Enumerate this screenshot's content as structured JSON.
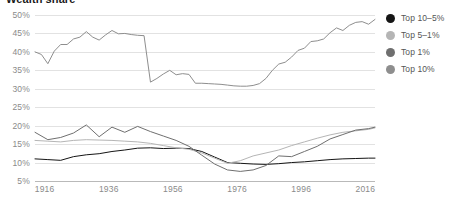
{
  "chart_data": {
    "type": "line",
    "title": "Wealth share",
    "xlabel": "",
    "ylabel": "",
    "xlim": [
      1913,
      2019
    ],
    "ylim": [
      5,
      50
    ],
    "grid": true,
    "y_tick_labels": [
      "50%",
      "45%",
      "40%",
      "35%",
      "30%",
      "25%",
      "20%",
      "15%",
      "10%",
      "5%"
    ],
    "y_tick_values": [
      50,
      45,
      40,
      35,
      30,
      25,
      20,
      15,
      10,
      5
    ],
    "x_tick_labels": [
      "1916",
      "1936",
      "1956",
      "1976",
      "1996",
      "2016"
    ],
    "x_tick_values": [
      1916,
      1936,
      1956,
      1976,
      1996,
      2016
    ],
    "legend_position": "right",
    "series": [
      {
        "name": "Top 10%",
        "color": "#8e8e8e",
        "x": [
          1913,
          1915,
          1917,
          1919,
          1921,
          1923,
          1925,
          1927,
          1929,
          1931,
          1933,
          1935,
          1937,
          1939,
          1941,
          1943,
          1945,
          1947,
          1949,
          1951,
          1953,
          1955,
          1957,
          1959,
          1961,
          1963,
          1965,
          1967,
          1969,
          1971,
          1973,
          1975,
          1977,
          1979,
          1981,
          1983,
          1985,
          1987,
          1989,
          1991,
          1993,
          1995,
          1997,
          1999,
          2001,
          2003,
          2005,
          2007,
          2009,
          2011,
          2013,
          2015,
          2017,
          2019
        ],
        "values": [
          40.0,
          39.3,
          36.8,
          40.2,
          42.0,
          42.0,
          43.5,
          44.0,
          45.5,
          44.0,
          43.2,
          44.6,
          45.8,
          44.9,
          45.0,
          44.7,
          44.5,
          44.4,
          31.8,
          32.8,
          34.0,
          35.0,
          33.8,
          34.1,
          33.9,
          31.5,
          31.5,
          31.4,
          31.3,
          31.2,
          31.0,
          30.8,
          30.7,
          30.7,
          30.9,
          31.4,
          32.8,
          35.0,
          36.7,
          37.2,
          38.6,
          40.4,
          41.0,
          42.8,
          43.0,
          43.5,
          45.2,
          46.5,
          45.8,
          47.2,
          48.0,
          48.2,
          47.5,
          48.8
        ]
      },
      {
        "name": "Top 10–5%",
        "color": "#151515",
        "x": [
          1913,
          1917,
          1921,
          1925,
          1929,
          1933,
          1937,
          1941,
          1945,
          1949,
          1953,
          1957,
          1961,
          1965,
          1969,
          1973,
          1977,
          1981,
          1985,
          1989,
          1993,
          1997,
          2001,
          2005,
          2009,
          2013,
          2017,
          2019
        ],
        "values": [
          11.0,
          10.8,
          10.6,
          11.6,
          12.1,
          12.4,
          13.0,
          13.4,
          13.9,
          14.0,
          13.8,
          13.9,
          13.8,
          13.0,
          11.5,
          10.0,
          9.8,
          9.6,
          9.5,
          9.7,
          10.0,
          10.2,
          10.5,
          10.8,
          11.0,
          11.1,
          11.2,
          11.2
        ]
      },
      {
        "name": "Top 5–1%",
        "color": "#b5b5b5",
        "x": [
          1913,
          1917,
          1921,
          1925,
          1929,
          1933,
          1937,
          1941,
          1945,
          1949,
          1953,
          1957,
          1961,
          1965,
          1969,
          1973,
          1977,
          1981,
          1985,
          1989,
          1993,
          1997,
          2001,
          2005,
          2009,
          2013,
          2017,
          2019
        ],
        "values": [
          16.0,
          15.8,
          15.6,
          16.0,
          16.2,
          16.1,
          16.0,
          15.8,
          15.6,
          15.2,
          14.6,
          14.0,
          13.6,
          12.6,
          11.2,
          9.8,
          10.5,
          11.8,
          12.6,
          13.4,
          14.6,
          15.6,
          16.6,
          17.5,
          18.2,
          18.6,
          19.0,
          19.4
        ]
      },
      {
        "name": "Top 1%",
        "color": "#6f6f6f",
        "x": [
          1913,
          1917,
          1921,
          1925,
          1929,
          1933,
          1937,
          1941,
          1945,
          1949,
          1953,
          1957,
          1961,
          1965,
          1969,
          1973,
          1977,
          1981,
          1985,
          1989,
          1993,
          1997,
          2001,
          2005,
          2009,
          2013,
          2017,
          2019
        ],
        "values": [
          18.2,
          16.2,
          16.8,
          18.0,
          20.2,
          17.0,
          19.6,
          18.2,
          19.8,
          18.4,
          17.2,
          16.0,
          14.4,
          12.0,
          9.6,
          8.0,
          7.6,
          8.0,
          9.2,
          11.8,
          11.6,
          13.0,
          14.4,
          16.4,
          17.6,
          18.8,
          19.2,
          19.6
        ]
      }
    ]
  },
  "legend": {
    "items": [
      {
        "label": "Top 10–5%",
        "color": "#151515"
      },
      {
        "label": "Top 5–1%",
        "color": "#b5b5b5"
      },
      {
        "label": "Top 1%",
        "color": "#6f6f6f"
      },
      {
        "label": "Top 10%",
        "color": "#8e8e8e"
      }
    ]
  }
}
